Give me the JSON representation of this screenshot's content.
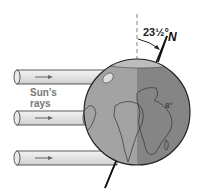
{
  "diagram": {
    "labels": {
      "sun_rays_line1": "Sun's",
      "sun_rays_line2": "rays",
      "tilt_angle": "23½°",
      "north": "N",
      "globe_mark": "8°"
    },
    "rays_count": 3,
    "colors": {
      "day_side": "#a3a3a3",
      "night_side": "#858585",
      "ray_fill": "#e6e6e6",
      "outline": "#222222",
      "dashed_axis": "#999999"
    }
  }
}
